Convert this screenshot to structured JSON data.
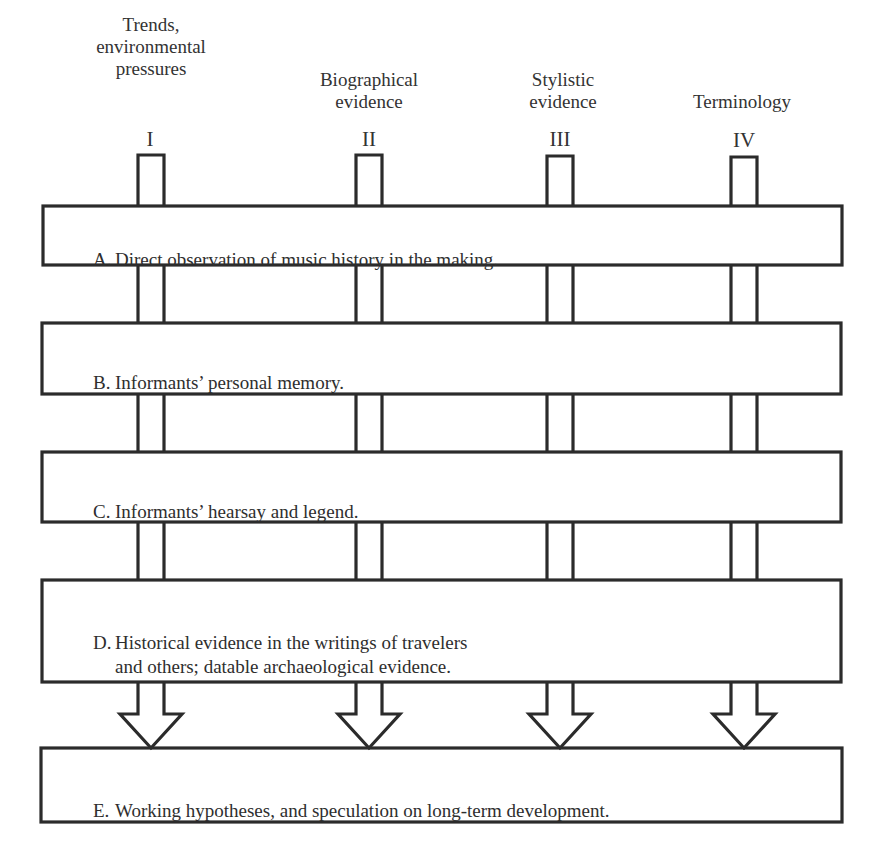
{
  "diagram": {
    "columns": [
      {
        "numeral": "I",
        "header_lines": "Trends,\nenvironmental\npressures",
        "x": 150
      },
      {
        "numeral": "II",
        "header_lines": "Biographical\nevidence",
        "x": 369
      },
      {
        "numeral": "III",
        "header_lines": "Stylistic\nevidence",
        "x": 560
      },
      {
        "numeral": "IV",
        "header_lines": "Terminology",
        "x": 744
      }
    ],
    "levels": [
      {
        "letter": "A.",
        "text": "Direct observation of music history in the making."
      },
      {
        "letter": "B.",
        "text": "Informants’ personal memory."
      },
      {
        "letter": "C.",
        "text": "Informants’ hearsay and legend."
      },
      {
        "letter": "D.",
        "text": "Historical evidence in the writings of travelers",
        "text_line2": "and others; datable archaeological evidence."
      },
      {
        "letter": "E.",
        "text": "Working hypotheses, and speculation on long-term development."
      }
    ],
    "colors": {
      "stroke": "#2b2b2b",
      "background": "#ffffff",
      "text": "#2e2e2e"
    }
  }
}
